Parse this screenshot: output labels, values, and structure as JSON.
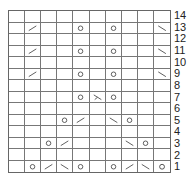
{
  "chart": {
    "columns": 10,
    "rows": [
      {
        "label": "14",
        "cells": [
          "",
          "",
          "",
          "",
          "",
          "",
          "",
          "",
          "",
          ""
        ]
      },
      {
        "label": "13",
        "cells": [
          "",
          "k2tog",
          "",
          "",
          "yo",
          "",
          "yo",
          "",
          "",
          "ssk"
        ]
      },
      {
        "label": "12",
        "cells": [
          "",
          "",
          "",
          "",
          "",
          "",
          "",
          "",
          "",
          ""
        ]
      },
      {
        "label": "11",
        "cells": [
          "",
          "k2tog",
          "",
          "",
          "yo",
          "",
          "yo",
          "",
          "",
          "ssk"
        ]
      },
      {
        "label": "10",
        "cells": [
          "",
          "",
          "",
          "",
          "",
          "",
          "",
          "",
          "",
          ""
        ]
      },
      {
        "label": "9",
        "cells": [
          "",
          "k2tog",
          "",
          "",
          "yo",
          "",
          "yo",
          "",
          "",
          "ssk"
        ]
      },
      {
        "label": "8",
        "cells": [
          "",
          "",
          "",
          "",
          "",
          "",
          "",
          "",
          "",
          ""
        ]
      },
      {
        "label": "7",
        "cells": [
          "",
          "",
          "",
          "",
          "yo",
          "sk2p",
          "yo",
          "",
          "",
          ""
        ]
      },
      {
        "label": "6",
        "cells": [
          "",
          "",
          "",
          "",
          "",
          "",
          "",
          "",
          "",
          ""
        ]
      },
      {
        "label": "5",
        "cells": [
          "",
          "",
          "",
          "yo",
          "k2tog",
          "",
          "ssk",
          "yo",
          "",
          ""
        ]
      },
      {
        "label": "4",
        "cells": [
          "",
          "",
          "",
          "",
          "",
          "",
          "",
          "",
          "",
          ""
        ]
      },
      {
        "label": "3",
        "cells": [
          "",
          "",
          "yo",
          "k2tog",
          "",
          "",
          "",
          "ssk",
          "yo",
          ""
        ]
      },
      {
        "label": "2",
        "cells": [
          "",
          "",
          "",
          "",
          "",
          "",
          "",
          "",
          "",
          ""
        ]
      },
      {
        "label": "1",
        "cells": [
          "",
          "yo",
          "k2tog",
          "ssk",
          "yo",
          "",
          "yo",
          "k2tog",
          "ssk",
          "yo"
        ]
      }
    ],
    "symbols": {
      "yo": "circle-icon",
      "k2tog": "right-slant-icon",
      "ssk": "left-slant-icon",
      "sk2p": "double-decrease-icon"
    }
  }
}
